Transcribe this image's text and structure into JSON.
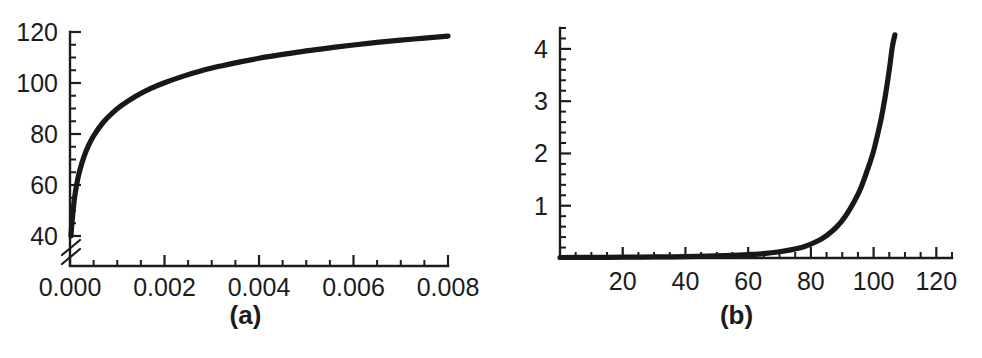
{
  "figure": {
    "background_color": "#ffffff",
    "ink_color": "#1c1c1c",
    "curve_color": "#181818",
    "panels": [
      {
        "id": "a",
        "label": "(a)"
      },
      {
        "id": "b",
        "label": "(b)"
      }
    ]
  },
  "chart_data": [
    {
      "type": "line",
      "panel": "a",
      "title": "",
      "subtitle": "",
      "xlabel": "",
      "ylabel": "",
      "xlim": [
        0.0,
        0.008
      ],
      "ylim": [
        40,
        120
      ],
      "grid": false,
      "legend": null,
      "y_axis_break": true,
      "y_axis_break_note": "axis broken below 40",
      "xticks": [
        0.0,
        0.002,
        0.004,
        0.006,
        0.008
      ],
      "xticklabels": [
        "0.000",
        "0.002",
        "0.004",
        "0.006",
        "0.008"
      ],
      "x_minor_step": 0.0005,
      "yticks": [
        40,
        60,
        80,
        100,
        120
      ],
      "yticklabels": [
        "40",
        "60",
        "80",
        "100",
        "120"
      ],
      "y_minor_step": 5,
      "series": [
        {
          "name": "curve-a",
          "x": [
            2e-05,
            5e-05,
            0.0001,
            0.00015,
            0.0002,
            0.0003,
            0.0004,
            0.0005,
            0.0007,
            0.0009,
            0.0011,
            0.0014,
            0.0017,
            0.002,
            0.0024,
            0.0028,
            0.0032,
            0.0036,
            0.004,
            0.0045,
            0.005,
            0.0055,
            0.006,
            0.0065,
            0.007,
            0.0075,
            0.008
          ],
          "y": [
            40.0,
            47.0,
            55.5,
            61.0,
            65.2,
            71.3,
            75.8,
            79.3,
            84.5,
            88.3,
            91.3,
            94.9,
            97.8,
            100.1,
            102.7,
            104.9,
            106.7,
            108.3,
            109.7,
            111.2,
            112.6,
            113.8,
            114.9,
            115.9,
            116.8,
            117.6,
            118.4
          ]
        }
      ]
    },
    {
      "type": "line",
      "panel": "b",
      "title": "",
      "subtitle": "",
      "xlabel": "",
      "ylabel": "",
      "xlim": [
        0,
        125
      ],
      "ylim": [
        0,
        4.4
      ],
      "grid": false,
      "legend": null,
      "y_axis_break": false,
      "xticks": [
        20,
        40,
        60,
        80,
        100,
        120
      ],
      "xticklabels": [
        "20",
        "40",
        "60",
        "80",
        "100",
        "120"
      ],
      "x_minor_step": 5,
      "yticks": [
        1,
        2,
        3,
        4
      ],
      "yticklabels": [
        "1",
        "2",
        "3",
        "4"
      ],
      "y_minor_step": 0.2,
      "series": [
        {
          "name": "curve-b",
          "x": [
            0,
            10,
            20,
            30,
            40,
            50,
            55,
            60,
            65,
            70,
            74,
            78,
            82,
            85,
            88,
            91,
            94,
            96,
            98,
            100,
            102,
            103,
            104,
            105,
            106,
            106.8
          ],
          "y": [
            0.01,
            0.012,
            0.015,
            0.02,
            0.027,
            0.04,
            0.05,
            0.065,
            0.085,
            0.12,
            0.16,
            0.22,
            0.32,
            0.43,
            0.58,
            0.8,
            1.1,
            1.35,
            1.68,
            2.05,
            2.55,
            2.85,
            3.2,
            3.6,
            4.05,
            4.27
          ]
        }
      ]
    }
  ]
}
